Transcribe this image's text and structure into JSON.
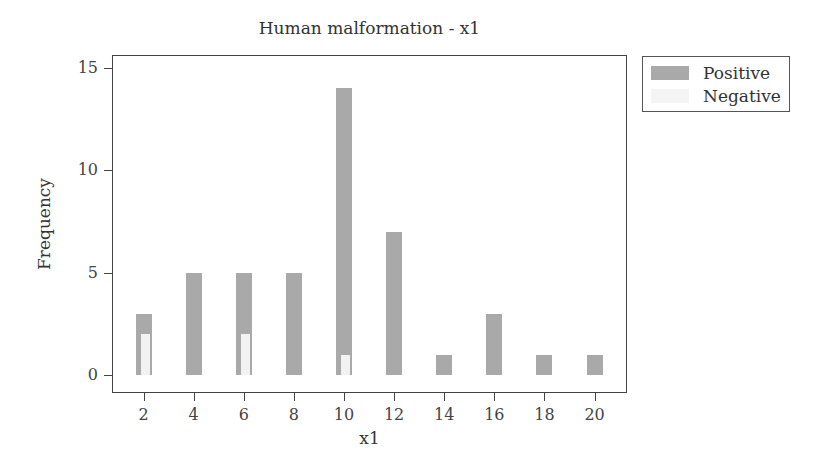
{
  "chart_data": {
    "type": "bar",
    "title": "Human malformation - x1",
    "xlabel": "x1",
    "ylabel": "Frequency",
    "categories": [
      2,
      4,
      6,
      8,
      10,
      12,
      14,
      16,
      18,
      20
    ],
    "series": [
      {
        "name": "Positive",
        "color": "#a9a9a9",
        "values": [
          3,
          5,
          5,
          5,
          14,
          7,
          1,
          3,
          1,
          1
        ]
      },
      {
        "name": "Negative",
        "color": "#f2f2f2",
        "values": [
          2,
          0,
          2,
          0,
          1,
          0,
          0,
          0,
          0,
          0
        ]
      }
    ],
    "ylim": [
      0,
      15.8
    ],
    "yticks": [
      0,
      5,
      10,
      15
    ],
    "xticks": [
      2,
      4,
      6,
      8,
      10,
      12,
      14,
      16,
      18,
      20
    ],
    "grid": false,
    "legend_position": "right-top, outside plot"
  },
  "labels": {
    "title": "Human malformation - x1",
    "xlabel": "x1",
    "ylabel": "Frequency",
    "legend": [
      "Positive",
      "Negative"
    ]
  }
}
